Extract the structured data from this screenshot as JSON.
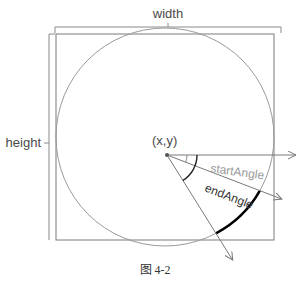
{
  "diagram": {
    "labels": {
      "width": "width",
      "height": "height",
      "center": "(x,y)",
      "start_angle": "startAngle",
      "end_angle": "endAngle"
    },
    "caption": "图 4-2",
    "angles_deg": {
      "start": 21,
      "end": 58
    },
    "colors": {
      "line": "#7a7a7a",
      "text": "#4a4a4a",
      "start_angle_text": "#9a9a9a",
      "arc_highlight": "#000000"
    }
  }
}
